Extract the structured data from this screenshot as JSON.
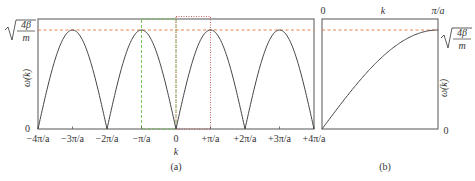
{
  "chart_data": [
    {
      "panel": "(a)",
      "type": "line",
      "title": "",
      "xlabel": "k",
      "ylabel": "ω(k)",
      "y_max_label": "√(4β/m)",
      "y_min_label": "0",
      "x_tick_labels": [
        "−4π/a",
        "−3π/a",
        "−2π/a",
        "−π/a",
        "0",
        "+π/a",
        "+2π/a",
        "+3π/a",
        "+4π/a"
      ],
      "x_ticks": [
        -4,
        -3,
        -2,
        -1,
        0,
        1,
        2,
        3,
        4
      ],
      "x_units": "π/a",
      "function": "ω(k) = √(4β/m)·|sin(ka/2)|",
      "xlim": [
        -4,
        4
      ],
      "ylim": [
        0,
        1.1
      ],
      "peaks_at": [
        -3,
        -1,
        1,
        3
      ],
      "zeros_at": [
        -4,
        -2,
        0,
        2,
        4
      ],
      "annotations": [
        {
          "type": "dashed-hline",
          "color": "#e8743b",
          "y": 1,
          "label": "max frequency"
        },
        {
          "type": "dashed-rect",
          "color": "#6abf4b",
          "x_range": [
            -1,
            0
          ],
          "label": "first Brillouin zone half"
        },
        {
          "type": "dotted-rect",
          "color": "#c0504d",
          "x_range": [
            0,
            1
          ],
          "label": "first Brillouin zone half"
        }
      ]
    },
    {
      "panel": "(b)",
      "type": "line",
      "title": "",
      "xlabel": "k",
      "ylabel": "ω(k)",
      "x_tick_labels": [
        "0",
        "π/a"
      ],
      "y_max_label": "√(4β/m)",
      "y_min_label": "0",
      "function": "ω(k) = √(4β/m)·sin(ka/2), 0 ≤ k ≤ π/a",
      "xlim": [
        0,
        1
      ],
      "ylim": [
        0,
        1.1
      ],
      "annotations": [
        {
          "type": "dashed-hline",
          "color": "#e8743b",
          "y": 1
        }
      ]
    }
  ],
  "labels": {
    "panel_a": "(a)",
    "panel_b": "(b)",
    "x_axis_a": "k",
    "x_axis_b": "k",
    "y_axis": "ω(k)",
    "zero": "0",
    "sqrt_num": "4β",
    "sqrt_den": "m",
    "b_top_left": "0",
    "b_top_right": "π/a",
    "ticks_a": [
      "−4π/a",
      "−3π/a",
      "−2π/a",
      "−π/a",
      "0",
      "+π/a",
      "+2π/a",
      "+3π/a",
      "+4π/a"
    ]
  },
  "colors": {
    "curve": "#444444",
    "frame": "#555555",
    "max_line": "#e8743b",
    "zone_green": "#6abf4b",
    "zone_red": "#c0504d"
  }
}
